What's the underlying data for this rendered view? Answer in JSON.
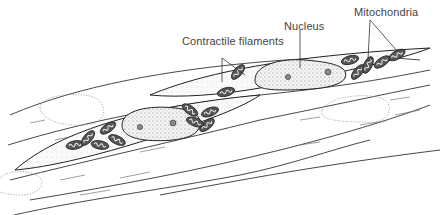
{
  "figure": {
    "labels": {
      "contractile": "Contractile filaments",
      "nucleus": "Nucleus",
      "mitochondria": "Mitochondria"
    }
  }
}
